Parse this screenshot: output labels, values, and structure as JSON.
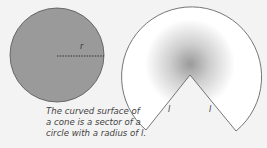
{
  "diagram": {
    "circle": {
      "label_radius": "r",
      "fill": "#9a9a9a",
      "stroke": "#555555"
    },
    "sector": {
      "label_left_edge": "l",
      "label_right_edge": "l",
      "fill": "#ffffff",
      "stroke": "#666666"
    },
    "caption": {
      "line1": "The curved surface of",
      "line2": "a cone is a sector of a",
      "line3": "circle with a radius of l."
    }
  }
}
